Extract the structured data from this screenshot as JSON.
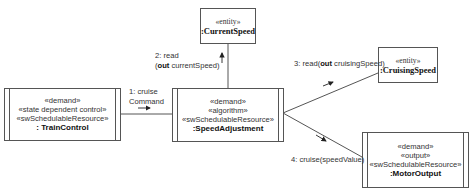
{
  "diagram": {
    "objects": [
      {
        "id": "current_speed",
        "stereotypes": [
          "«entity»"
        ],
        "name": ":CurrentSpeed",
        "kind": "entity"
      },
      {
        "id": "train_control",
        "stereotypes": [
          "«demand»",
          "«state dependent control»",
          "«swSchedulableResource»"
        ],
        "name": ": TrainControl",
        "kind": "active"
      },
      {
        "id": "speed_adjustment",
        "stereotypes": [
          "«demand»",
          "«algorithm»",
          "«swSchedulableResource»"
        ],
        "name": ":SpeedAdjustment",
        "kind": "active"
      },
      {
        "id": "cruising_speed",
        "stereotypes": [
          "«entity»"
        ],
        "name": ":CruisingSpeed",
        "kind": "entity"
      },
      {
        "id": "motor_output",
        "stereotypes": [
          "«demand»",
          "«output»",
          "«swSchedulableResource»"
        ],
        "name": ":MotorOutput",
        "kind": "active"
      }
    ],
    "messages": [
      {
        "seq": "1:",
        "line1": "1: cruise",
        "line2": "Command",
        "from": "train_control",
        "to": "speed_adjustment"
      },
      {
        "seq": "2:",
        "line1": "2: read",
        "line2_open": "(",
        "line2_kw": "out",
        "line2_rest": " currentSpeed)",
        "from": "speed_adjustment",
        "to": "current_speed"
      },
      {
        "seq": "3:",
        "prefix": "3: read(",
        "kw": "out",
        "rest": " cruisingSpeed)",
        "from": "speed_adjustment",
        "to": "cruising_speed"
      },
      {
        "seq": "4:",
        "text": "4: cruise(speedValue)",
        "from": "speed_adjustment",
        "to": "motor_output"
      }
    ],
    "line_color": "#555555"
  }
}
